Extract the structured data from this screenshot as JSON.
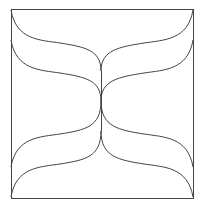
{
  "diagram": {
    "type": "line-pattern",
    "frame": {
      "x": 11,
      "y": 9,
      "width": 182,
      "height": 189,
      "stroke": "#444444"
    },
    "center_line_x": 101,
    "stroke_color": "#444444",
    "stroke_width": 1,
    "curves": [
      {
        "name": "top-left-upper",
        "d": "M11,10 C16,40 40,40 60,43 C85,47 101,50 101,71"
      },
      {
        "name": "top-left-lower",
        "d": "M11,40 C16,70 40,70 60,73 C85,77 101,80 101,101"
      },
      {
        "name": "top-right-upper",
        "d": "M193,10 C188,40 164,40 144,43 C119,47 101,50 101,71"
      },
      {
        "name": "top-right-lower",
        "d": "M193,40 C188,70 164,70 144,73 C119,77 101,80 101,101"
      },
      {
        "name": "bottom-left-upper",
        "d": "M11,167 C16,137 40,137 60,134 C85,130 101,127 101,101"
      },
      {
        "name": "bottom-left-lower",
        "d": "M11,197 C16,167 40,167 60,164 C85,160 101,157 101,131"
      },
      {
        "name": "bottom-right-upper",
        "d": "M193,167 C188,137 164,137 144,134 C119,130 101,127 101,101"
      },
      {
        "name": "bottom-right-lower",
        "d": "M193,197 C188,167 164,167 144,164 C119,160 101,157 101,131"
      }
    ]
  }
}
